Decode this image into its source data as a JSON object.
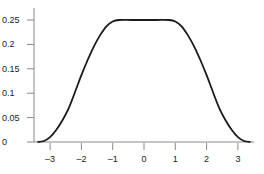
{
  "chart_data": {
    "type": "line",
    "title": "",
    "xlabel": "",
    "ylabel": "",
    "xlim": [
      -3.5,
      3.5
    ],
    "ylim": [
      0,
      0.27
    ],
    "grid": false,
    "legend": null,
    "x_ticks": [
      -3,
      -2,
      -1,
      0,
      1,
      2,
      3
    ],
    "x_tick_labels": [
      "–3",
      "–2",
      "–1",
      "0",
      "1",
      "2",
      "3"
    ],
    "y_ticks": [
      0,
      0.05,
      0.1,
      0.15,
      0.2,
      0.25
    ],
    "y_tick_labels": [
      "0",
      "0.05",
      "0.1",
      "0.15",
      "0.2",
      "0.25"
    ],
    "series": [
      {
        "name": "curve",
        "color": "#1a1a1a",
        "x": [
          -3.4,
          -3.2,
          -3.0,
          -2.8,
          -2.6,
          -2.4,
          -2.2,
          -2.0,
          -1.8,
          -1.6,
          -1.4,
          -1.2,
          -1.0,
          -0.8,
          -0.4,
          0,
          0.4,
          0.8,
          1.0,
          1.2,
          1.4,
          1.6,
          1.8,
          2.0,
          2.2,
          2.4,
          2.6,
          2.8,
          3.0,
          3.2,
          3.4
        ],
        "y": [
          0.0,
          0.002,
          0.01,
          0.025,
          0.045,
          0.07,
          0.103,
          0.137,
          0.168,
          0.196,
          0.219,
          0.237,
          0.247,
          0.25,
          0.25,
          0.25,
          0.25,
          0.25,
          0.247,
          0.237,
          0.219,
          0.196,
          0.168,
          0.137,
          0.103,
          0.07,
          0.045,
          0.025,
          0.01,
          0.002,
          0.0
        ]
      }
    ]
  }
}
